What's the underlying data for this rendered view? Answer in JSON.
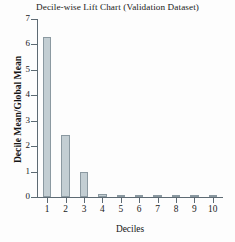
{
  "chart_data": {
    "type": "bar",
    "title": "Decile-wise Lift Chart (Validation Dataset)",
    "xlabel": "Deciles",
    "ylabel": "Decile Mean/Global Mean",
    "categories": [
      "1",
      "2",
      "3",
      "4",
      "5",
      "6",
      "7",
      "8",
      "9",
      "10"
    ],
    "values": [
      6.3,
      2.42,
      0.98,
      0.1,
      0.08,
      0.05,
      0.05,
      0.04,
      0.04,
      0.03
    ],
    "ylim": [
      0,
      7
    ],
    "yticks": [
      0,
      1,
      2,
      3,
      4,
      5,
      6,
      7
    ],
    "ytick_labels": [
      "0",
      "1",
      "2",
      "3",
      "4",
      "5",
      "6",
      "7"
    ],
    "grid": false,
    "legend": null,
    "bar_fill_color": "#c3ced3",
    "bar_edge_color": "#8b99a1",
    "axis_color": "#5d6a73"
  }
}
